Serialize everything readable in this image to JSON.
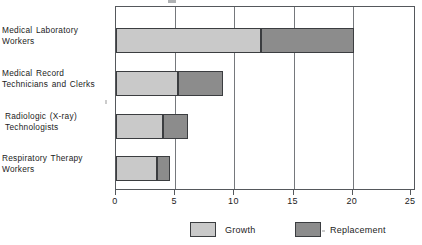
{
  "chart_data": {
    "type": "bar",
    "orientation": "horizontal",
    "stacked": true,
    "title": "",
    "xlabel": "",
    "ylabel": "",
    "xlim": [
      0,
      25
    ],
    "xticks": [
      0,
      5,
      10,
      15,
      20,
      25
    ],
    "xtick_labels": [
      "0",
      "5",
      "10",
      "15",
      "20",
      "25"
    ],
    "grid": true,
    "grid_axis": "x",
    "legend_position": "bottom",
    "categories": [
      "Medical Laboratory Workers",
      "Medical Record Technicians and Clerks",
      "Radiologic (X-ray) Technologists",
      "Respiratory Therapy Workers"
    ],
    "category_lines": [
      [
        "Medical Laboratory",
        "Workers"
      ],
      [
        "Medical Record",
        "Technicians and Clerks"
      ],
      [
        "Radiologic (X-ray)",
        "Technologists"
      ],
      [
        "Respiratory Therapy",
        "Workers"
      ]
    ],
    "series": [
      {
        "name": "Growth",
        "color": "#c9c9c9",
        "values": [
          12.25,
          5.25,
          4.0,
          3.5
        ]
      },
      {
        "name": "Replacement",
        "color": "#8c8c8c",
        "values": [
          7.85,
          3.75,
          2.1,
          1.1
        ]
      }
    ],
    "totals": [
      20.1,
      9.0,
      6.1,
      4.6
    ]
  },
  "legend": {
    "items": [
      {
        "label": "Growth",
        "swatch": "growth-swatch"
      },
      {
        "label": "Replacement",
        "swatch": "replacement-swatch"
      }
    ]
  },
  "axis": {
    "tick_labels": [
      "0",
      "5",
      "10",
      "15",
      "20",
      "25"
    ]
  },
  "colors": {
    "growth": "#c9c9c9",
    "replacement": "#8c8c8c",
    "frame": "#55585c",
    "gridline": "#75787c",
    "bar_outline": "#3b3d40",
    "text": "#1c1c1c",
    "background": "#ffffff"
  }
}
